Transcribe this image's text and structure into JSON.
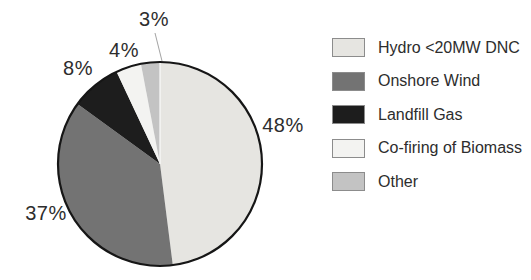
{
  "figure": {
    "background": "#ffffff",
    "pie_outline_color": "#161616",
    "leader_line_color": "#a3a3a3",
    "divider_color": "#fafafa"
  },
  "chart_data": {
    "type": "pie",
    "title": "",
    "legend_position": "right",
    "direction": "clockwise",
    "start_angle_deg": 0,
    "center_x": 160,
    "center_y": 164,
    "radius": 102,
    "categories": [
      "Hydro <20MW DNC",
      "Onshore Wind",
      "Landfill Gas",
      "Co-firing of Biomass",
      "Other"
    ],
    "values": [
      48,
      37,
      8,
      4,
      3
    ],
    "slices": [
      {
        "label": "Hydro <20MW DNC",
        "value": 48,
        "display": "48%",
        "color": "#e6e5e1",
        "label_x": 283,
        "label_y": 125
      },
      {
        "label": "Onshore Wind",
        "value": 37,
        "display": "37%",
        "color": "#737373",
        "label_x": 46,
        "label_y": 213
      },
      {
        "label": "Landfill Gas",
        "value": 8,
        "display": "8%",
        "color": "#1d1d1d",
        "label_x": 78,
        "label_y": 68
      },
      {
        "label": "Co-firing of Biomass",
        "value": 4,
        "display": "4%",
        "color": "#f3f3f1",
        "label_x": 124,
        "label_y": 50
      },
      {
        "label": "Other",
        "value": 3,
        "display": "3%",
        "color": "#c3c3c3",
        "label_x": 154,
        "label_y": 19,
        "leader_line": {
          "x1": 155,
          "y1": 33,
          "x2": 162,
          "y2": 61
        }
      }
    ]
  }
}
